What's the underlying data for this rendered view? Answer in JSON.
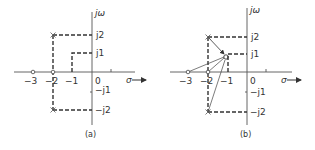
{
  "panels": [
    {
      "id": "a",
      "caption": "(a)",
      "axis_labels": {
        "imag": "jω",
        "real": "σ"
      },
      "real_ticks": [
        "−3",
        "−2",
        "−1",
        "0"
      ],
      "imag_ticks": [
        "j2",
        "j1",
        "−j1",
        "−j2"
      ],
      "poles": [
        {
          "re": -2,
          "im": 2
        },
        {
          "re": -2,
          "im": -2
        }
      ],
      "zeros": [
        {
          "re": -3,
          "im": 0
        },
        {
          "re": -2,
          "im": 0
        }
      ],
      "test_point": {
        "re": -1,
        "im": 1
      }
    },
    {
      "id": "b",
      "caption": "(b)",
      "axis_labels": {
        "imag": "jω",
        "real": "σ"
      },
      "real_ticks": [
        "−3",
        "−2",
        "−1",
        "0"
      ],
      "imag_ticks": [
        "j2",
        "j1",
        "−j1",
        "−j2"
      ],
      "poles": [
        {
          "re": -2,
          "im": 2
        },
        {
          "re": -2,
          "im": -2
        }
      ],
      "zeros": [
        {
          "re": -3,
          "im": 0
        },
        {
          "re": -2,
          "im": 0
        }
      ],
      "test_point": {
        "re": -1,
        "im": 1
      },
      "vectors_to_test_point": true
    }
  ]
}
